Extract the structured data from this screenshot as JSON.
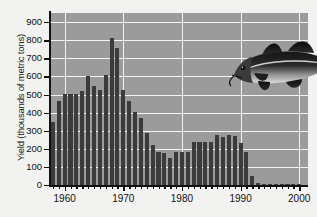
{
  "figure": {
    "background_color": "#f2f2f0",
    "plot_background_color": "#9b9b9b",
    "bar_color": "#3b3b3b",
    "grid_color": "#f4f4f4",
    "axis_color": "#111111"
  },
  "axes": {
    "ylabel": "Yield (thousands of metric tons)",
    "xlabel": "",
    "y_ticks": [
      "0",
      "100",
      "200",
      "300",
      "400",
      "500",
      "600",
      "700",
      "800",
      "900"
    ],
    "x_ticks": [
      "1960",
      "1970",
      "1980",
      "1990",
      "2000"
    ]
  },
  "decoration": {
    "fish_icon_name": "atlantic-cod-photo",
    "fish_alt": "Atlantic cod"
  },
  "chart_data": {
    "type": "bar",
    "title": "",
    "subtitle": "",
    "xlabel": "",
    "ylabel": "Yield (thousands of metric tons)",
    "xlim": [
      1957.5,
      2001.5
    ],
    "ylim": [
      0,
      950
    ],
    "ytick_values": [
      0,
      100,
      200,
      300,
      400,
      500,
      600,
      700,
      800,
      900
    ],
    "xtick_values": [
      1960,
      1970,
      1980,
      1990,
      2000
    ],
    "grid": true,
    "legend": null,
    "annotations": [
      {
        "type": "image",
        "label": "Atlantic cod",
        "x": 1990,
        "y": 700
      }
    ],
    "categories": [
      1958,
      1959,
      1960,
      1961,
      1962,
      1963,
      1964,
      1965,
      1966,
      1967,
      1968,
      1969,
      1970,
      1971,
      1972,
      1973,
      1974,
      1975,
      1976,
      1977,
      1978,
      1979,
      1980,
      1981,
      1982,
      1983,
      1984,
      1985,
      1986,
      1987,
      1988,
      1989,
      1990,
      1991,
      1992,
      1993,
      1994,
      1995,
      1996,
      1997,
      1998,
      1999,
      2000
    ],
    "values": [
      350,
      465,
      505,
      505,
      505,
      520,
      600,
      545,
      525,
      610,
      810,
      755,
      525,
      465,
      405,
      370,
      290,
      220,
      185,
      175,
      150,
      180,
      180,
      180,
      240,
      240,
      240,
      240,
      275,
      265,
      275,
      270,
      235,
      180,
      50,
      12,
      3,
      3,
      3,
      3,
      3,
      3,
      3
    ]
  }
}
